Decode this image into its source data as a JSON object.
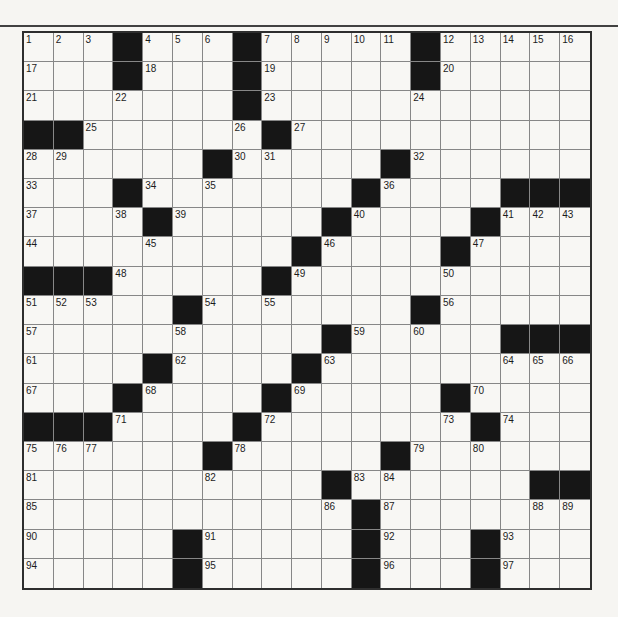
{
  "page": {
    "background": "#f6f5f2",
    "top_rule_color": "#414141"
  },
  "grid": {
    "rows": 19,
    "cols": 19,
    "colors": {
      "black_square": "#161616",
      "cell_white": "#f8f7f4",
      "line": "#878787",
      "outer_border": "#2e2e2e",
      "number_text": "#1c1c1c"
    },
    "pattern": [
      "...#...#.....#.....",
      "...#...#.....#.....",
      ".......#...........",
      "##......#..........",
      "......#.....#......",
      "...#.......#....###",
      "....#.....#....#...",
      ".........#....#....",
      "###.....#..........",
      ".....#.......#.....",
      "..........#.....###",
      "....#....#.........",
      "...#....#.....#....",
      "###....#.......#...",
      "......#.....#......",
      "..........#......##",
      "...........#.......",
      ".....#.....#...#...",
      ".....#.....#...#..."
    ],
    "numbers": {
      "0-0": 1,
      "0-1": 2,
      "0-2": 3,
      "0-4": 4,
      "0-5": 5,
      "0-6": 6,
      "0-8": 7,
      "0-9": 8,
      "0-10": 9,
      "0-11": 10,
      "0-12": 11,
      "0-14": 12,
      "0-15": 13,
      "0-16": 14,
      "0-17": 15,
      "0-18": 16,
      "1-0": 17,
      "1-4": 18,
      "1-8": 19,
      "1-14": 20,
      "2-0": 21,
      "2-3": 22,
      "2-8": 23,
      "2-13": 24,
      "3-2": 25,
      "3-7": 26,
      "3-9": 27,
      "4-0": 28,
      "4-1": 29,
      "4-7": 30,
      "4-8": 31,
      "4-13": 32,
      "5-0": 33,
      "5-4": 34,
      "5-6": 35,
      "5-12": 36,
      "6-0": 37,
      "6-3": 38,
      "6-5": 39,
      "6-11": 40,
      "6-16": 41,
      "6-17": 42,
      "6-18": 43,
      "7-0": 44,
      "7-4": 45,
      "7-10": 46,
      "7-15": 47,
      "8-3": 48,
      "8-9": 49,
      "8-14": 50,
      "9-0": 51,
      "9-1": 52,
      "9-2": 53,
      "9-6": 54,
      "9-8": 55,
      "9-14": 56,
      "10-0": 57,
      "10-5": 58,
      "10-11": 59,
      "10-13": 60,
      "11-0": 61,
      "11-5": 62,
      "11-10": 63,
      "11-16": 64,
      "11-17": 65,
      "11-18": 66,
      "12-0": 67,
      "12-4": 68,
      "12-9": 69,
      "12-15": 70,
      "13-3": 71,
      "13-8": 72,
      "13-14": 73,
      "13-16": 74,
      "14-0": 75,
      "14-1": 76,
      "14-2": 77,
      "14-7": 78,
      "14-13": 79,
      "14-15": 80,
      "15-0": 81,
      "15-6": 82,
      "15-11": 83,
      "15-12": 84,
      "16-0": 85,
      "16-10": 86,
      "16-12": 87,
      "16-17": 88,
      "16-18": 89,
      "17-0": 90,
      "17-6": 91,
      "17-12": 92,
      "17-16": 93,
      "18-0": 94,
      "18-6": 95,
      "18-12": 96,
      "18-16": 97
    }
  }
}
